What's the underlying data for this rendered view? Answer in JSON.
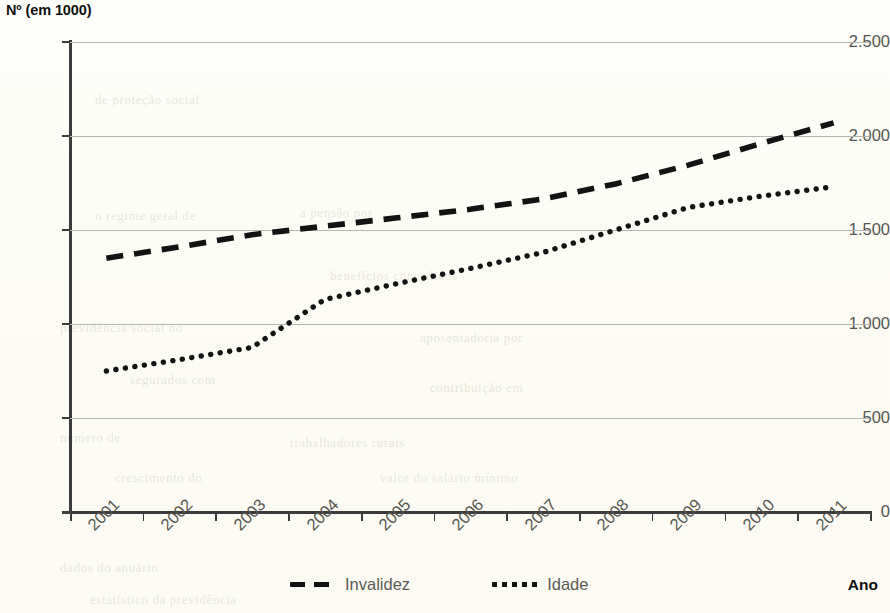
{
  "chart": {
    "y_axis_title": "Nº (em 1000)",
    "x_axis_title": "Ano"
  },
  "legend": {
    "items": [
      {
        "label": "Invalidez",
        "marker": "dashed-line-swatch"
      },
      {
        "label": "Idade",
        "marker": "dotted-line-swatch"
      }
    ]
  },
  "chart_data": {
    "type": "line",
    "title": "",
    "subtitle": "",
    "xlabel": "Ano",
    "ylabel": "Nº (em 1000)",
    "categories": [
      "2001",
      "2002",
      "2003",
      "2004",
      "2005",
      "2006",
      "2007",
      "2008",
      "2009",
      "2010",
      "2011"
    ],
    "x_tick_labels": [
      "2001",
      "2002",
      "2003",
      "2004",
      "2005",
      "2006",
      "2007",
      "2008",
      "2009",
      "2010",
      "2011"
    ],
    "y_tick_labels": [
      "0",
      "500",
      "1.000",
      "1.500",
      "2.000",
      "2.500"
    ],
    "y_tick_values": [
      0,
      500,
      1000,
      1500,
      2000,
      2500
    ],
    "ylim": [
      0,
      2500
    ],
    "grid": "horizontal",
    "legend_position": "bottom",
    "series": [
      {
        "name": "Invalidez",
        "style": "dashed",
        "color": "#131313",
        "values": [
          1350,
          1410,
          1475,
          1520,
          1565,
          1610,
          1665,
          1745,
          1845,
          1960,
          2070
        ]
      },
      {
        "name": "Idade",
        "style": "dotted",
        "color": "#131313",
        "values": [
          750,
          810,
          875,
          1130,
          1215,
          1295,
          1380,
          1500,
          1620,
          1680,
          1730
        ]
      }
    ]
  },
  "background_texture": {
    "ghosts": [
      {
        "text": "de proteção social",
        "x": 95,
        "y": 92
      },
      {
        "text": "a pensão por",
        "x": 300,
        "y": 205
      },
      {
        "text": "o regime geral de",
        "x": 95,
        "y": 208
      },
      {
        "text": "benefícios concedidos",
        "x": 330,
        "y": 268
      },
      {
        "text": "previdência social no",
        "x": 60,
        "y": 320
      },
      {
        "text": "aposentadoria por",
        "x": 420,
        "y": 330
      },
      {
        "text": "segurados com",
        "x": 130,
        "y": 372
      },
      {
        "text": "contribuição em",
        "x": 430,
        "y": 380
      },
      {
        "text": "número de",
        "x": 60,
        "y": 430
      },
      {
        "text": "trabalhadores rurais",
        "x": 290,
        "y": 435
      },
      {
        "text": "crescimento do",
        "x": 115,
        "y": 470
      },
      {
        "text": "valor do salário mínimo",
        "x": 380,
        "y": 470
      },
      {
        "text": "dados do anuário",
        "x": 60,
        "y": 560
      },
      {
        "text": "estatístico da previdência",
        "x": 90,
        "y": 592
      }
    ]
  },
  "colors": {
    "page_background": "#fdfdf7",
    "axis": "#3b3b3b",
    "gridline": "#b7b7b2",
    "tick_label": "#56564f",
    "series_ink": "#131313",
    "title_ink": "#101010"
  }
}
